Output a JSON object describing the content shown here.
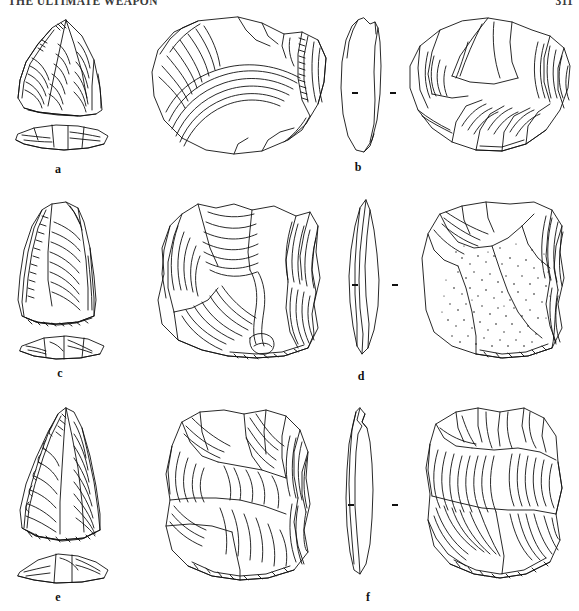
{
  "header": {
    "running_title": "THE ULTIMATE WEAPON",
    "page_number": "311"
  },
  "figure": {
    "caption_labels": [
      "a",
      "b",
      "c",
      "d",
      "e",
      "f"
    ],
    "items": [
      {
        "label": "a",
        "views": [
          "scaled-front-view",
          "scaled-profile-view"
        ],
        "description": "triangular retouched point, reduced scale with side profile beneath"
      },
      {
        "label": "b",
        "views": [
          "ventral-face",
          "cross-section-profile",
          "dorsal-face"
        ],
        "description": "discoidal flake, ventral face with concentric ripples, edge profile, dorsal face with radial flake scars"
      },
      {
        "label": "c",
        "views": [
          "scaled-front-view",
          "scaled-profile-view"
        ],
        "description": "sub-triangular flake, reduced scale with side profile beneath"
      },
      {
        "label": "d",
        "views": [
          "ventral-face",
          "cross-section-profile",
          "dorsal-face"
        ],
        "description": "quadrangular flake, ventral face with ripples, edge profile, dorsal face retaining stippled cortex"
      },
      {
        "label": "e",
        "views": [
          "scaled-front-view",
          "scaled-profile-view"
        ],
        "description": "elongated convergent point, reduced scale with side profile beneath"
      },
      {
        "label": "f",
        "views": [
          "ventral-face",
          "cross-section-profile",
          "dorsal-face"
        ],
        "description": "rectangular flake, ventral face, narrow edge profile, dorsal face with sweeping flake scars"
      }
    ],
    "scale_ticks": {
      "count": 6,
      "meaning": "paired alignment ticks flanking each cross-section profile"
    }
  },
  "colors": {
    "ink": "#111111",
    "paper": "#ffffff",
    "header_ink": "#3a3a3a"
  }
}
